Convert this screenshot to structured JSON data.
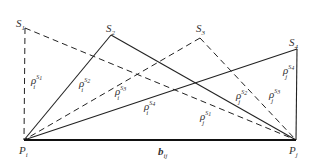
{
  "diagram": {
    "points": {
      "Pi": {
        "label": "P",
        "sub": "i",
        "x": 24,
        "y": 140
      },
      "Pj": {
        "label": "P",
        "sub": "j",
        "x": 296,
        "y": 140
      },
      "S1": {
        "label": "S",
        "sub": "1",
        "x": 25,
        "y": 28
      },
      "S2": {
        "label": "S",
        "sub": "2",
        "x": 111,
        "y": 35
      },
      "S3": {
        "label": "S",
        "sub": "3",
        "x": 200,
        "y": 38
      },
      "S4": {
        "label": "S",
        "sub": "4",
        "x": 297,
        "y": 49
      }
    },
    "baseline": {
      "label": "b",
      "sub": "ij"
    },
    "rho_labels": [
      {
        "base": "ρ",
        "sub": "i",
        "sup": "S",
        "supsub": "1"
      },
      {
        "base": "ρ",
        "sub": "i",
        "sup": "S",
        "supsub": "2"
      },
      {
        "base": "ρ",
        "sub": "i",
        "sup": "S",
        "supsub": "3"
      },
      {
        "base": "ρ",
        "sub": "i",
        "sup": "S",
        "supsub": "4"
      },
      {
        "base": "ρ",
        "sub": "j",
        "sup": "S",
        "supsub": "1"
      },
      {
        "base": "ρ",
        "sub": "j",
        "sup": "S",
        "supsub": "2"
      },
      {
        "base": "ρ",
        "sub": "j",
        "sup": "S",
        "supsub": "3"
      },
      {
        "base": "ρ",
        "sub": "j",
        "sup": "S",
        "supsub": "4"
      }
    ],
    "line_styles": {
      "S1": "dashed",
      "S2": "solid",
      "S3": "dashed",
      "S4": "solid"
    },
    "colors": {
      "stroke": "#222222",
      "text": "#333333"
    }
  }
}
